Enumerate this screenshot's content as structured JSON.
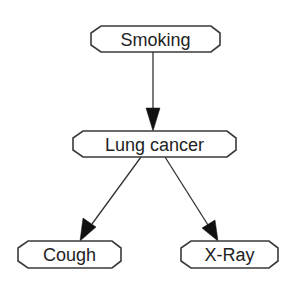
{
  "diagram": {
    "type": "bayesian-network",
    "nodes": [
      {
        "id": "smoking",
        "label": "Smoking",
        "x": 91,
        "y": 26,
        "w": 129,
        "h": 26
      },
      {
        "id": "lung_cancer",
        "label": "Lung cancer",
        "x": 73,
        "y": 131,
        "w": 163,
        "h": 26
      },
      {
        "id": "cough",
        "label": "Cough",
        "x": 18,
        "y": 241,
        "w": 103,
        "h": 27
      },
      {
        "id": "xray",
        "label": "X-Ray",
        "x": 181,
        "y": 241,
        "w": 97,
        "h": 27
      }
    ],
    "edges": [
      {
        "from": "smoking",
        "to": "lung_cancer"
      },
      {
        "from": "lung_cancer",
        "to": "cough"
      },
      {
        "from": "lung_cancer",
        "to": "xray"
      }
    ]
  },
  "colors": {
    "background": "#ffffff",
    "node_border": "#3a3a3a",
    "text": "#222222",
    "edge": "#333333"
  }
}
